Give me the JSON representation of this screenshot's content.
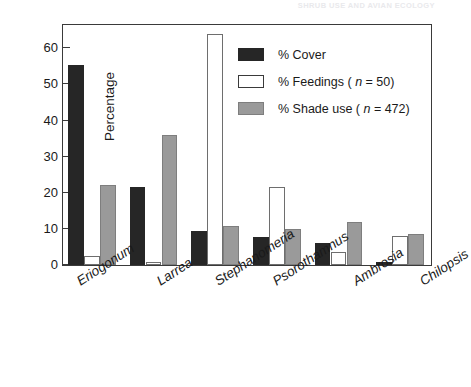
{
  "running_header": "SHRUB USE AND AVIAN ECOLOGY",
  "chart_data": {
    "type": "bar",
    "title": "",
    "xlabel": "",
    "ylabel": "Percentage",
    "ylim": [
      0,
      67
    ],
    "yticks": [
      0,
      10,
      20,
      30,
      40,
      50,
      60
    ],
    "ytick_labels": [
      "0",
      "10",
      "20",
      "30",
      "40",
      "50",
      "60"
    ],
    "grid": false,
    "legend_position": "top-right",
    "categories": [
      "Eriogonum",
      "Larrea",
      "Stephanomeria",
      "Psorothamnus",
      "Ambrosia",
      "Chilopsis"
    ],
    "series": [
      {
        "name": "% Cover",
        "key": "cover",
        "color": "#262626",
        "values": [
          55.5,
          21.6,
          9.5,
          7.7,
          6.0,
          0.8
        ]
      },
      {
        "name": "% Feedings ( n = 50)",
        "key": "feed",
        "color": "#ffffff",
        "values": [
          2.4,
          0.8,
          64.0,
          21.7,
          3.5,
          8.0
        ]
      },
      {
        "name": "% Shade use ( n = 472)",
        "key": "shade",
        "color": "#9a9a9a",
        "values": [
          22.2,
          36.0,
          10.7,
          10.0,
          12.0,
          8.7
        ]
      }
    ]
  },
  "legend": {
    "items": [
      {
        "label": "% Cover",
        "swatch": "cover"
      },
      {
        "label": "% Feedings ( n = 50)",
        "swatch": "feed"
      },
      {
        "label": "% Shade use ( n = 472)",
        "swatch": "shade"
      }
    ]
  },
  "colors": {
    "cover": "#262626",
    "feed": "#ffffff",
    "shade": "#9a9a9a",
    "axis": "#3a3a3a",
    "text": "#1a1a1a"
  }
}
